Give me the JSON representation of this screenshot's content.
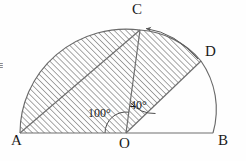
{
  "figure": {
    "type": "geometry-diagram",
    "background_color": "#fefefe",
    "line_color": "#4a4a4a",
    "hatch_color": "#555555",
    "text_color": "#1a1a1a"
  },
  "vertices": {
    "A": {
      "label": "A",
      "x": 20,
      "y": 133,
      "label_x": 11,
      "label_y": 136
    },
    "B": {
      "label": "B",
      "x": 213,
      "y": 133,
      "label_x": 219,
      "label_y": 136
    },
    "C": {
      "label": "C",
      "x": 140,
      "y": 30,
      "label_x": 133,
      "label_y": 2
    },
    "D": {
      "label": "D",
      "x": 201,
      "y": 61,
      "label_x": 205,
      "label_y": 44
    },
    "O": {
      "label": "O",
      "x": 126,
      "y": 133,
      "label_x": 120,
      "label_y": 137
    }
  },
  "angles": [
    {
      "label": "100°",
      "value": 100,
      "unit": "degrees",
      "at": "O",
      "between": [
        "OA",
        "OC"
      ],
      "label_x": 88,
      "label_y": 106
    },
    {
      "label": "40°",
      "value": 40,
      "unit": "degrees",
      "at": "O",
      "between": [
        "OC",
        "OD"
      ],
      "label_x": 130,
      "label_y": 100
    }
  ],
  "segments": [
    {
      "name": "diameter-AB",
      "from": "A",
      "to": "B"
    },
    {
      "name": "radius-OC",
      "from": "O",
      "to": "C"
    },
    {
      "name": "radius-OD",
      "from": "O",
      "to": "D"
    },
    {
      "name": "chord-AC",
      "from": "A",
      "to": "C"
    }
  ],
  "arcs": [
    {
      "name": "arc-AC",
      "from": "A",
      "to": "C",
      "hatched": true
    },
    {
      "name": "arc-CD",
      "from": "C",
      "to": "D",
      "hatched": true
    },
    {
      "name": "arc-DB",
      "from": "D",
      "to": "B",
      "hatched": false
    }
  ],
  "shaded_region": {
    "name": "hatched-region",
    "hatch_angle_degrees": 45,
    "hatch_spacing_px": 3,
    "bounded_by": [
      "A",
      "arc-AC",
      "C",
      "arc-CD",
      "D",
      "O"
    ]
  },
  "annotations": {
    "rotation_arrow": {
      "name": "rotation-arrow-d-to-c",
      "from": "D",
      "to": "C",
      "direction": "counterclockwise",
      "arrowhead_at": "C"
    },
    "left_edge_mark": {
      "name": "clipped-edge-glyph",
      "text": "≡",
      "x": 0,
      "y": 58
    }
  }
}
